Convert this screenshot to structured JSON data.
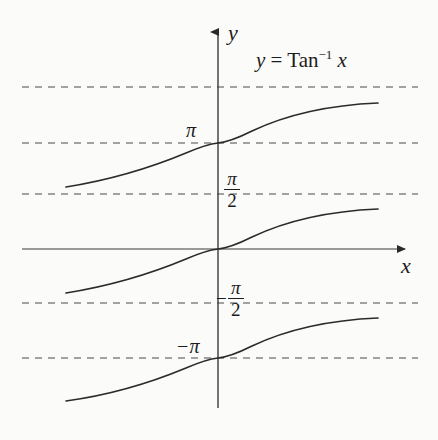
{
  "figure": {
    "background_color": "#fbfbf9",
    "ink_color": "#1c1c1c",
    "width": 438,
    "height": 440
  },
  "title": {
    "full_text": "y = Tan-1 x",
    "lhs": "y",
    "equals": "=",
    "function_name": "Tan",
    "exponent": "−1",
    "variable": "x"
  },
  "axes": {
    "y_label": "y",
    "x_label": "x",
    "x_axis_y_px": 249,
    "y_axis_x_px": 218,
    "origin": [
      218,
      249
    ]
  },
  "tick_labels": {
    "pi": "π",
    "neg_pi": "−π",
    "pi_over_two_numerator": "π",
    "pi_over_two_denominator": "2",
    "neg_pi_over_two_minus": "−",
    "neg_pi_over_two_numerator": "π",
    "neg_pi_over_two_denominator": "2"
  },
  "chart_data": {
    "type": "line",
    "xlabel": "x",
    "ylabel": "y",
    "grid": false,
    "legend": "none",
    "xlim": [
      -8,
      8
    ],
    "ylim": [
      -6.28,
      6.28
    ],
    "y_ticks": [
      {
        "label": "π",
        "value": 3.1416,
        "pixel_y": 143,
        "side": "left"
      },
      {
        "label": "π/2",
        "value": 1.5708,
        "pixel_y": 194,
        "side": "right"
      },
      {
        "label": "−π/2",
        "value": -1.5708,
        "pixel_y": 303,
        "side": "right"
      },
      {
        "label": "−π",
        "value": -3.1416,
        "pixel_y": 358,
        "side": "left"
      }
    ],
    "asymptotes": [
      {
        "label": "3π/2",
        "value": 4.7124,
        "pixel_y": 87,
        "style": "dashed"
      },
      {
        "label": "π",
        "value": 3.1416,
        "pixel_y": 143,
        "style": "dashed"
      },
      {
        "label": "π/2",
        "value": 1.5708,
        "pixel_y": 194,
        "style": "dashed"
      },
      {
        "label": "−π/2",
        "value": -1.5708,
        "pixel_y": 303,
        "style": "dashed"
      },
      {
        "label": "−π",
        "value": -3.1416,
        "pixel_y": 358,
        "style": "dashed"
      }
    ],
    "series": [
      {
        "name": "Tan⁻¹ x + π",
        "offset": 3.1416,
        "crosses_y_axis_at": 3.1416,
        "path": "M 66 187 C 110 180 150 168 186 153 C 200 147 208 144 218 143 C 228 142 238 138 252 131 C 288 114 330 105 378 103"
      },
      {
        "name": "Tan⁻¹ x",
        "offset": 0,
        "crosses_y_axis_at": 0,
        "path": "M 66 293 C 110 286 150 274 186 259 C 200 253 208 250 218 249 C 228 248 238 244 252 237 C 288 220 330 211 378 209"
      },
      {
        "name": "Tan⁻¹ x − π",
        "offset": -3.1416,
        "crosses_y_axis_at": -3.1416,
        "path": "M 66 401 C 110 395 150 383 186 368 C 200 362 208 359 218 358 C 228 357 238 353 252 346 C 288 329 330 320 378 318"
      }
    ],
    "branch_x_range_px": [
      66,
      378
    ],
    "dashed_line_x_range_px": [
      22,
      418
    ]
  }
}
